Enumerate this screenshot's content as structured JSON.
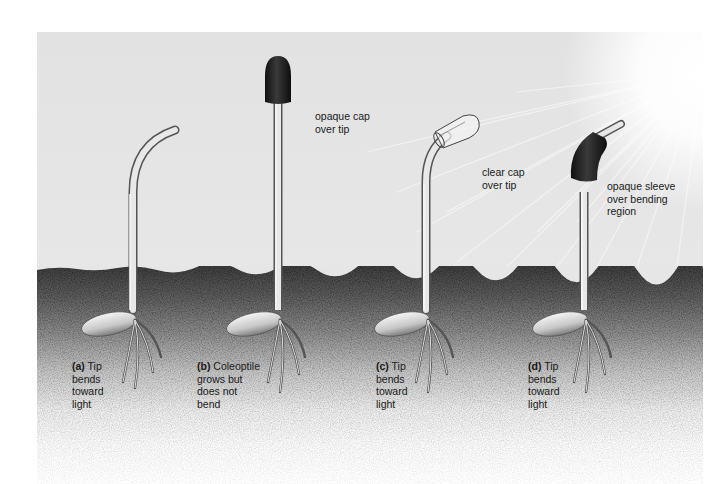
{
  "figure": {
    "colors": {
      "sky": "#e4e4e4",
      "soil_dark": "#3e3e3e",
      "cap_opaque": "#1e1e1e",
      "stem": "#d8d8d8",
      "text": "#1a1a1a"
    },
    "light_source": "sun-rays-upper-right",
    "panels": [
      {
        "id": "a",
        "letter": "(a)",
        "caption": "Tip bends toward light",
        "caption_lines": [
          "Tip",
          "bends",
          "toward",
          "light"
        ],
        "treatment": "",
        "treatment_lines": []
      },
      {
        "id": "b",
        "letter": "(b)",
        "caption": "Coleoptile grows but does not bend",
        "caption_lines": [
          "Coleoptile",
          "grows but",
          "does not",
          "bend"
        ],
        "treatment": "opaque cap over tip",
        "treatment_lines": [
          "opaque cap",
          "over tip"
        ]
      },
      {
        "id": "c",
        "letter": "(c)",
        "caption": "Tip bends toward light",
        "caption_lines": [
          "Tip",
          "bends",
          "toward",
          "light"
        ],
        "treatment": "clear cap over tip",
        "treatment_lines": [
          "clear cap",
          "over tip"
        ]
      },
      {
        "id": "d",
        "letter": "(d)",
        "caption": "Tip bends toward light",
        "caption_lines": [
          "Tip",
          "bends",
          "toward",
          "light"
        ],
        "treatment": "opaque sleeve over bending region",
        "treatment_lines": [
          "opaque sleeve",
          "over bending",
          "region"
        ]
      }
    ]
  }
}
